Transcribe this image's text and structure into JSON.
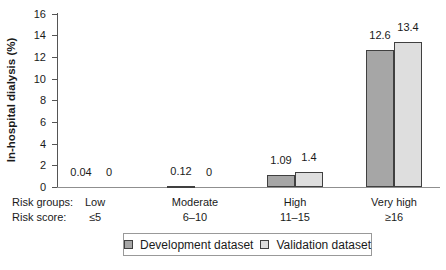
{
  "chart_data": {
    "type": "bar",
    "title": "",
    "ylabel": "In-hospital dialysis (%)",
    "xlabel": "",
    "ylim": [
      0,
      16
    ],
    "ytick_step": 2,
    "yticks": [
      "0",
      "2",
      "4",
      "6",
      "8",
      "10",
      "12",
      "14",
      "16"
    ],
    "grid": false,
    "legend_position": "bottom",
    "categories": [
      "Low",
      "Moderate",
      "High",
      "Very high"
    ],
    "risk_scores": [
      "≤5",
      "6–10",
      "11–15",
      "≥16"
    ],
    "row_labels": {
      "groups": "Risk groups:",
      "score": "Risk score:"
    },
    "series": [
      {
        "name": "Development dataset",
        "color": "#a6a6a6",
        "values": [
          0.04,
          0.12,
          1.09,
          12.6
        ],
        "value_labels": [
          "0.04",
          "0.12",
          "1.09",
          "12.6"
        ]
      },
      {
        "name": "Validation dataset",
        "color": "#dedede",
        "values": [
          0,
          0,
          1.4,
          13.4
        ],
        "value_labels": [
          "0",
          "0",
          "1.4",
          "13.4"
        ]
      }
    ]
  },
  "colors": {
    "text": "#1a1a1a",
    "axis": "#555555",
    "baseline": "#8f8f8f",
    "bar_border": "#404040",
    "legend_border": "#999999",
    "development_fill": "#a6a6a6",
    "validation_fill": "#dedede"
  }
}
